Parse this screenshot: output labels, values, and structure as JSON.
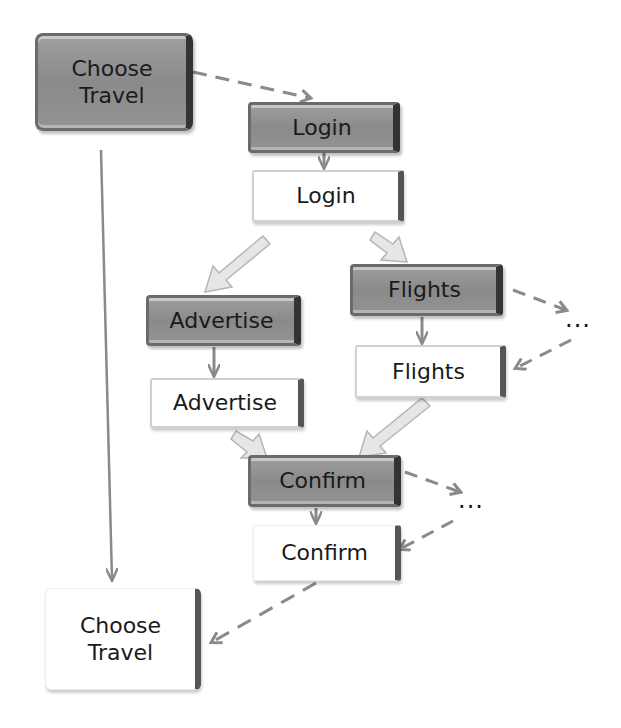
{
  "diagram": {
    "type": "flow",
    "nodes": [
      {
        "id": "choose_travel_top",
        "label": "Choose Travel",
        "style": "gray"
      },
      {
        "id": "login_gray",
        "label": "Login",
        "style": "gray"
      },
      {
        "id": "login_white",
        "label": "Login",
        "style": "white"
      },
      {
        "id": "advertise_gray",
        "label": "Advertise",
        "style": "gray"
      },
      {
        "id": "advertise_white",
        "label": "Advertise",
        "style": "white"
      },
      {
        "id": "flights_gray",
        "label": "Flights",
        "style": "gray"
      },
      {
        "id": "flights_white",
        "label": "Flights",
        "style": "white"
      },
      {
        "id": "confirm_gray",
        "label": "Confirm",
        "style": "gray"
      },
      {
        "id": "confirm_white",
        "label": "Confirm",
        "style": "white"
      },
      {
        "id": "choose_travel_bottom",
        "label": "Choose Travel",
        "style": "white"
      }
    ],
    "ellipses": [
      {
        "id": "flights_ellipsis",
        "label": "..."
      },
      {
        "id": "confirm_ellipsis",
        "label": "..."
      }
    ],
    "edges": [
      {
        "from": "choose_travel_top",
        "to": "login_gray",
        "style": "dashed"
      },
      {
        "from": "choose_travel_top",
        "to": "choose_travel_bottom",
        "style": "solid"
      },
      {
        "from": "login_gray",
        "to": "login_white",
        "style": "solid"
      },
      {
        "from": "login_white",
        "to": "advertise_gray",
        "style": "block"
      },
      {
        "from": "login_white",
        "to": "flights_gray",
        "style": "block"
      },
      {
        "from": "advertise_gray",
        "to": "advertise_white",
        "style": "solid"
      },
      {
        "from": "flights_gray",
        "to": "flights_white",
        "style": "solid"
      },
      {
        "from": "flights_gray",
        "to": "flights_ellipsis",
        "style": "dashed"
      },
      {
        "from": "flights_ellipsis",
        "to": "flights_white",
        "style": "dashed"
      },
      {
        "from": "advertise_white",
        "to": "confirm_gray",
        "style": "block"
      },
      {
        "from": "flights_white",
        "to": "confirm_gray",
        "style": "block"
      },
      {
        "from": "confirm_gray",
        "to": "confirm_white",
        "style": "solid"
      },
      {
        "from": "confirm_gray",
        "to": "confirm_ellipsis",
        "style": "dashed"
      },
      {
        "from": "confirm_ellipsis",
        "to": "confirm_white",
        "style": "dashed"
      },
      {
        "from": "confirm_white",
        "to": "choose_travel_bottom",
        "style": "dashed"
      }
    ],
    "colors": {
      "gray_box": "#939393",
      "white_box": "#ffffff",
      "edge": "#8a8a8a",
      "block_arrow": "#e2e2e2"
    }
  }
}
